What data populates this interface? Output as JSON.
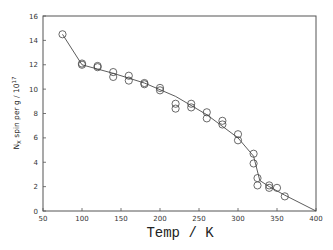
{
  "chart_data": {
    "type": "scatter",
    "title": "",
    "xlabel": "Temp / K",
    "ylabel": "N_X spin per g / 10^17",
    "ylabel_parts": {
      "main": "N",
      "sub": "X",
      "rest": " spin per g / 10",
      "sup": "17"
    },
    "xlim": [
      50,
      400
    ],
    "ylim": [
      0,
      16
    ],
    "xticks": [
      50,
      100,
      150,
      200,
      250,
      300,
      350,
      400
    ],
    "yticks": [
      0,
      2,
      4,
      6,
      8,
      10,
      12,
      14,
      16
    ],
    "grid": false,
    "legend": null,
    "series": [
      {
        "name": "measured",
        "marker": "open-circle",
        "points": [
          [
            75,
            14.5
          ],
          [
            100,
            12.0
          ],
          [
            100,
            12.1
          ],
          [
            120,
            11.9
          ],
          [
            120,
            11.8
          ],
          [
            140,
            11.4
          ],
          [
            140,
            11.0
          ],
          [
            160,
            11.1
          ],
          [
            160,
            10.7
          ],
          [
            180,
            10.5
          ],
          [
            180,
            10.4
          ],
          [
            200,
            10.1
          ],
          [
            200,
            9.9
          ],
          [
            220,
            8.8
          ],
          [
            220,
            8.4
          ],
          [
            240,
            8.8
          ],
          [
            240,
            8.5
          ],
          [
            260,
            8.1
          ],
          [
            260,
            7.6
          ],
          [
            280,
            7.4
          ],
          [
            280,
            7.1
          ],
          [
            300,
            6.3
          ],
          [
            300,
            5.8
          ],
          [
            320,
            4.7
          ],
          [
            320,
            3.9
          ],
          [
            325,
            2.7
          ],
          [
            325,
            2.1
          ],
          [
            340,
            2.1
          ],
          [
            340,
            1.9
          ],
          [
            350,
            1.9
          ],
          [
            360,
            1.2
          ]
        ]
      },
      {
        "name": "fit curve",
        "marker": "none",
        "line": "solid",
        "points": [
          [
            75,
            14.5
          ],
          [
            100,
            12.0
          ],
          [
            140,
            11.3
          ],
          [
            180,
            10.5
          ],
          [
            220,
            9.4
          ],
          [
            260,
            7.9
          ],
          [
            300,
            6.0
          ],
          [
            320,
            4.5
          ],
          [
            328,
            2.5
          ],
          [
            340,
            2.0
          ],
          [
            360,
            1.3
          ],
          [
            400,
            0
          ]
        ]
      }
    ]
  }
}
